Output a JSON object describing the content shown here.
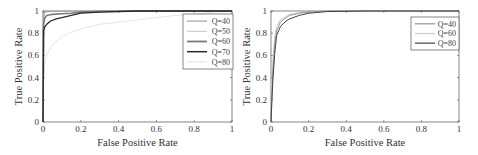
{
  "chart_data": [
    {
      "type": "line",
      "title": "",
      "xlabel": "False Positive Rate",
      "ylabel": "True Positive Rate",
      "xlim": [
        0,
        1
      ],
      "ylim": [
        0,
        1
      ],
      "xticks": [
        "0",
        "0.2",
        "0.4",
        "0.6",
        "0.8",
        "1"
      ],
      "yticks": [
        "0",
        "0.2",
        "0.4",
        "0.6",
        "0.8",
        "1"
      ],
      "grid": false,
      "legend_position": "upper right",
      "series": [
        {
          "name": "Q=40",
          "color": "#9a9a9a",
          "width": 0.9,
          "x": [
            0,
            0.002,
            0.005,
            0.01,
            0.02,
            0.05,
            0.1,
            0.2,
            0.5,
            1
          ],
          "y": [
            0,
            0.9,
            0.97,
            0.99,
            0.995,
            0.997,
            0.998,
            0.999,
            1,
            1
          ]
        },
        {
          "name": "Q=50",
          "color": "#c8c8c8",
          "width": 0.9,
          "x": [
            0,
            0.002,
            0.005,
            0.01,
            0.02,
            0.05,
            0.1,
            0.2,
            0.5,
            1
          ],
          "y": [
            0,
            0.85,
            0.95,
            0.98,
            0.99,
            0.995,
            0.997,
            0.999,
            1,
            1
          ]
        },
        {
          "name": "Q=60",
          "color": "#7a7a7a",
          "width": 1.6,
          "x": [
            0,
            0.003,
            0.01,
            0.02,
            0.05,
            0.1,
            0.15,
            0.2,
            0.3,
            0.5,
            1
          ],
          "y": [
            0,
            0.88,
            0.94,
            0.96,
            0.97,
            0.975,
            0.98,
            0.99,
            0.995,
            1,
            1
          ]
        },
        {
          "name": "Q=70",
          "color": "#2a2a2a",
          "width": 1.3,
          "x": [
            0,
            0.003,
            0.01,
            0.02,
            0.04,
            0.07,
            0.1,
            0.15,
            0.2,
            0.3,
            0.5,
            1
          ],
          "y": [
            0,
            0.82,
            0.86,
            0.88,
            0.91,
            0.93,
            0.94,
            0.96,
            0.98,
            0.99,
            1,
            1
          ]
        },
        {
          "name": "Q=80",
          "color": "#e4e4e4",
          "width": 1.0,
          "x": [
            0,
            0.01,
            0.03,
            0.05,
            0.1,
            0.15,
            0.2,
            0.3,
            0.4,
            0.5,
            0.6,
            0.7,
            0.8,
            0.9,
            1
          ],
          "y": [
            0.3,
            0.55,
            0.64,
            0.7,
            0.77,
            0.81,
            0.84,
            0.88,
            0.9,
            0.92,
            0.94,
            0.96,
            0.97,
            0.99,
            1
          ]
        }
      ]
    },
    {
      "type": "line",
      "title": "",
      "xlabel": "False Positive Rate",
      "ylabel": "True Positive Rate",
      "xlim": [
        0,
        1
      ],
      "ylim": [
        0,
        1
      ],
      "xticks": [
        "0",
        "0.2",
        "0.4",
        "0.6",
        "0.8",
        "1"
      ],
      "yticks": [
        "0",
        "0.2",
        "0.4",
        "0.6",
        "0.8",
        "1"
      ],
      "grid": false,
      "legend_position": "upper right",
      "series": [
        {
          "name": "Q=40",
          "color": "#8a8a8a",
          "width": 0.9,
          "x": [
            0,
            0.005,
            0.01,
            0.02,
            0.03,
            0.05,
            0.08,
            0.1,
            0.15,
            0.2,
            0.3,
            0.5,
            1
          ],
          "y": [
            0,
            0.25,
            0.45,
            0.7,
            0.82,
            0.9,
            0.94,
            0.96,
            0.98,
            0.99,
            1,
            1,
            1
          ]
        },
        {
          "name": "Q=60",
          "color": "#cccccc",
          "width": 1.0,
          "x": [
            0,
            0.005,
            0.01,
            0.02,
            0.03,
            0.05,
            0.08,
            0.1,
            0.15,
            0.2,
            0.3,
            0.5,
            1
          ],
          "y": [
            0,
            0.3,
            0.55,
            0.78,
            0.86,
            0.92,
            0.95,
            0.97,
            0.985,
            0.99,
            1,
            1,
            1
          ]
        },
        {
          "name": "Q=80",
          "color": "#444444",
          "width": 1.0,
          "x": [
            0,
            0.005,
            0.01,
            0.02,
            0.03,
            0.05,
            0.08,
            0.1,
            0.15,
            0.2,
            0.3,
            0.5,
            1
          ],
          "y": [
            0,
            0.2,
            0.38,
            0.62,
            0.78,
            0.86,
            0.91,
            0.93,
            0.96,
            0.98,
            0.995,
            1,
            1
          ]
        }
      ]
    }
  ]
}
